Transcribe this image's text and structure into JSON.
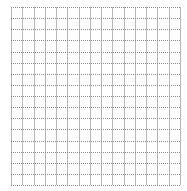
{
  "grid": {
    "background": "#ffffff",
    "vertical_line_color": "#b8b8b8",
    "horizontal_line_color": "#8a8a8a",
    "x_start": 11,
    "x_end": 180,
    "y_start": 7,
    "y_end": 185,
    "columns": 15,
    "rows": 16,
    "horizontal_dash": "1,1"
  }
}
